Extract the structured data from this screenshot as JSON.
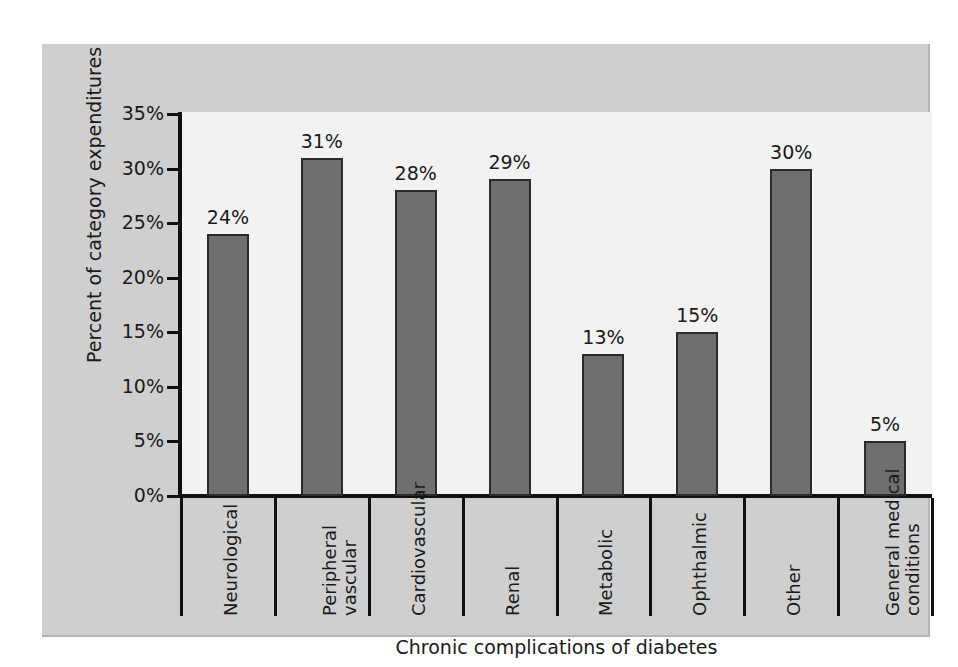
{
  "chart_data": {
    "type": "bar",
    "title": "",
    "xlabel": "Chronic complications of diabetes",
    "ylabel": "Percent of category expenditures",
    "categories": [
      "Neurological",
      "Peripheral vascular",
      "Cardiovascular",
      "Renal",
      "Metabolic",
      "Ophthalmic",
      "Other",
      "General medical conditions"
    ],
    "category_lines": [
      [
        "Neurological"
      ],
      [
        "Peripheral",
        "vascular"
      ],
      [
        "Cardiovascular"
      ],
      [
        "Renal"
      ],
      [
        "Metabolic"
      ],
      [
        "Ophthalmic"
      ],
      [
        "Other"
      ],
      [
        "General medical",
        "conditions"
      ]
    ],
    "values": [
      24,
      31,
      28,
      29,
      13,
      15,
      30,
      5
    ],
    "data_labels": [
      "24%",
      "31%",
      "28%",
      "29%",
      "13%",
      "15%",
      "30%",
      "5%"
    ],
    "ylim": [
      0,
      35
    ],
    "ytick_values": [
      0,
      5,
      10,
      15,
      20,
      25,
      30,
      35
    ],
    "ytick_labels": [
      "0%",
      "5%",
      "10%",
      "15%",
      "20%",
      "25%",
      "30%",
      "35%"
    ],
    "grid": false,
    "legend": null,
    "series": [
      {
        "name": "Percent of category expenditures",
        "values": [
          24,
          31,
          28,
          29,
          13,
          15,
          30,
          5
        ]
      }
    ]
  },
  "colors": {
    "bar_fill": "#6e6e6e",
    "bar_outline": "#2b2b2b",
    "panel_background": "#cfcfcf",
    "plot_background": "#f2f2f2",
    "axis": "#111111",
    "text": "#1a1a1a"
  }
}
